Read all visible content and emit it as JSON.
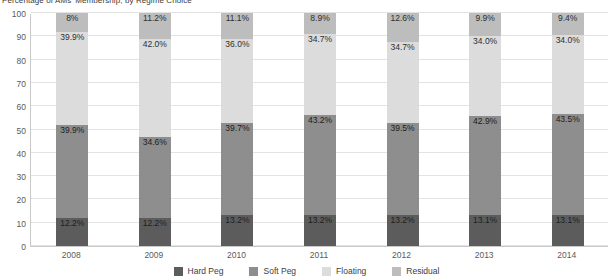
{
  "chart_data": {
    "type": "bar",
    "subtype": "stacked-bar-100",
    "title": "Percentage of AMs' Membership, by Regime Choice",
    "xlabel": "",
    "ylabel": "",
    "ylim": [
      0,
      100
    ],
    "yticks": [
      0,
      10,
      20,
      30,
      40,
      50,
      60,
      70,
      80,
      90,
      100
    ],
    "ytick_labels": [
      "0",
      "10",
      "20",
      "30",
      "40",
      "50",
      "60",
      "70",
      "80",
      "90",
      "100"
    ],
    "grid": true,
    "grid_axis": "y",
    "legend_position": "bottom",
    "categories": [
      "2008",
      "2009",
      "2010",
      "2011",
      "2012",
      "2013",
      "2014"
    ],
    "series": [
      {
        "name": "Hard Peg",
        "color": "#5c5c5c",
        "values": [
          12.2,
          12.2,
          13.2,
          13.2,
          13.2,
          13.1,
          13.1
        ],
        "labels": [
          "12.2%",
          "12.2%",
          "13.2%",
          "13.2%",
          "13.2%",
          "13.1%",
          "13.1%"
        ]
      },
      {
        "name": "Soft Peg",
        "color": "#8e8e8e",
        "values": [
          39.9,
          34.6,
          39.7,
          43.2,
          39.5,
          42.9,
          43.5
        ],
        "labels": [
          "39.9%",
          "34.6%",
          "39.7%",
          "43.2%",
          "39.5%",
          "42.9%",
          "43.5%"
        ]
      },
      {
        "name": "Floating",
        "color": "#dcdcdc",
        "values": [
          39.9,
          42.0,
          36.0,
          34.7,
          34.7,
          34.0,
          34.0
        ],
        "labels": [
          "39.9%",
          "42.0%",
          "36.0%",
          "34.7%",
          "34.7%",
          "34.0%",
          "34.0%"
        ]
      },
      {
        "name": "Residual",
        "color": "#bdbdbd",
        "values": [
          8.0,
          11.2,
          11.1,
          8.9,
          12.6,
          9.9,
          9.4
        ],
        "labels": [
          "8%",
          "11.2%",
          "11.1%",
          "8.9%",
          "12.6%",
          "9.9%",
          "9.4%"
        ]
      }
    ]
  },
  "legend": {
    "items": [
      {
        "label": "Hard Peg",
        "color": "#5c5c5c"
      },
      {
        "label": "Soft Peg",
        "color": "#8e8e8e"
      },
      {
        "label": "Floating",
        "color": "#dcdcdc"
      },
      {
        "label": "Residual",
        "color": "#bdbdbd"
      }
    ]
  }
}
